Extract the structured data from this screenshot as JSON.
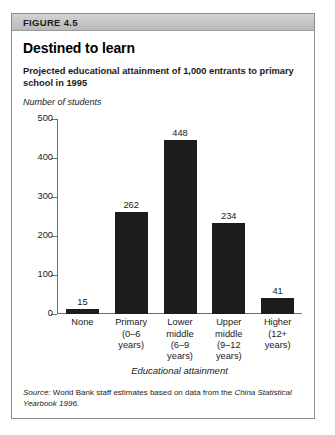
{
  "figure": {
    "number_label": "FIGURE 4.5",
    "title": "Destined to learn",
    "subtitle": "Projected educational attainment of 1,000 entrants to primary school in 1995",
    "source_prefix": "Source:",
    "source_text": " World Bank staff estimates based on data from the ",
    "source_italic": "China Statistical Yearbook 1996.",
    "frame_border_color": "#8c8c8c",
    "header_band_color": "#c4c4c4",
    "bar_color": "#1c1c1c",
    "axis_color": "#6e6e6e"
  },
  "chart_data": {
    "type": "bar",
    "title": "Destined to learn",
    "subtitle": "Projected educational attainment of 1,000 entrants to primary school in 1995",
    "categories": [
      "None",
      "Primary\n(0–6\nyears)",
      "Lower\nmiddle\n(6–9\nyears)",
      "Upper\nmiddle\n(9–12\nyears)",
      "Higher\n(12+\nyears)"
    ],
    "values": [
      15,
      262,
      448,
      234,
      41
    ],
    "data_labels": [
      "15",
      "262",
      "448",
      "234",
      "41"
    ],
    "xlabel": "Educational attainment",
    "ylabel": "Number of students",
    "ylim": [
      0,
      500
    ],
    "yticks": [
      0,
      100,
      200,
      300,
      400,
      500
    ],
    "ytick_labels": [
      "0",
      "100",
      "200",
      "300",
      "400",
      "500"
    ],
    "grid": false,
    "legend": false
  }
}
